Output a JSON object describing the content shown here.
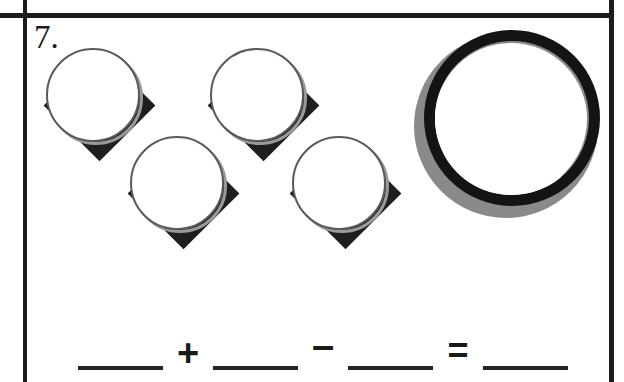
{
  "worksheet": {
    "problem_number": "7.",
    "instruction_type": "count-and-compute",
    "borders": {
      "color": "#1c1c1c"
    }
  },
  "counters": {
    "label": "diamond-circle-counters",
    "count": 4,
    "items": [
      {
        "id": "counter-1",
        "shape": "diamond-with-circle"
      },
      {
        "id": "counter-2",
        "shape": "diamond-with-circle"
      },
      {
        "id": "counter-3",
        "shape": "diamond-with-circle"
      },
      {
        "id": "counter-4",
        "shape": "diamond-with-circle"
      }
    ],
    "diamond_color": "#1f1f1f",
    "circle_fill": "#ffffff",
    "circle_stroke": "#5a5a5a"
  },
  "ring": {
    "label": "large-double-ring",
    "count": 1,
    "outer_ring_color": "#8a8a8a",
    "inner_ring_color": "#141414",
    "center_fill": "#ffffff"
  },
  "equation": {
    "blank_1": "",
    "operator_1": "+",
    "blank_2": "",
    "operator_2": "–",
    "blank_3": "",
    "operator_3": "=",
    "blank_4": ""
  }
}
